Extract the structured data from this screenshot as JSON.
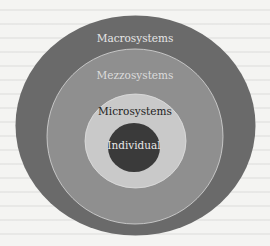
{
  "diagram": {
    "type": "concentric-circles",
    "layers": [
      {
        "id": "macrosystems",
        "label": "Macrosystems",
        "fill": "#6a6a6a",
        "text_color": "#e6e6e6",
        "shape": {
          "cx": 135.5,
          "cy": 125.5,
          "rx": 120,
          "ry": 110
        },
        "label_pos": {
          "x": 135,
          "y": 39
        }
      },
      {
        "id": "mezzosystems",
        "label": "Mezzosystems",
        "fill": "#8f8f8f",
        "text_color": "#dcdcdc",
        "shape": {
          "cx": 135,
          "cy": 136.5,
          "rx": 88,
          "ry": 87.5
        },
        "label_pos": {
          "x": 135,
          "y": 76
        }
      },
      {
        "id": "microsystems",
        "label": "Microsystems",
        "fill": "#c9c9c9",
        "text_color": "#222222",
        "shape": {
          "cx": 135.5,
          "cy": 141,
          "rx": 50.5,
          "ry": 47
        },
        "label_pos": {
          "x": 135,
          "y": 112
        }
      },
      {
        "id": "individual",
        "label": "Individual",
        "fill": "#3a3a3a",
        "text_color": "#e8e8e8",
        "shape": {
          "cx": 134,
          "cy": 147.5,
          "rx": 26,
          "ry": 24.5
        },
        "label_pos": {
          "x": 134,
          "y": 146
        }
      }
    ],
    "stroke_color": "#d8d8d8",
    "background": "#f4f4f2"
  }
}
